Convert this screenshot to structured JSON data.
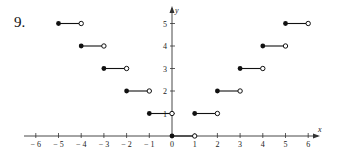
{
  "problem": {
    "number": "9."
  },
  "colors": {
    "ink": "#111111",
    "axis": "#333333",
    "background": "#ffffff"
  },
  "chart_data": {
    "type": "line",
    "title": "",
    "xlabel": "x",
    "ylabel": "y",
    "xlim": [
      -6.4,
      6.6
    ],
    "ylim": [
      0,
      5.6
    ],
    "grid": false,
    "x_ticks": [
      -6,
      -5,
      -4,
      -3,
      -2,
      -1,
      0,
      1,
      2,
      3,
      4,
      5,
      6
    ],
    "x_tick_labels": [
      "− 6",
      "− 5",
      "− 4",
      "− 3",
      "− 2",
      "− 1",
      "0",
      "1",
      "2",
      "3",
      "4",
      "5",
      "6"
    ],
    "y_ticks": [
      1,
      2,
      3,
      4,
      5
    ],
    "y_tick_labels": [
      "1",
      "2",
      "3",
      "4",
      "5"
    ],
    "segments": [
      {
        "x_start": -5,
        "x_end": -4,
        "y": 5,
        "start": "closed",
        "end": "open"
      },
      {
        "x_start": -4,
        "x_end": -3,
        "y": 4,
        "start": "closed",
        "end": "open"
      },
      {
        "x_start": -3,
        "x_end": -2,
        "y": 3,
        "start": "closed",
        "end": "open"
      },
      {
        "x_start": -2,
        "x_end": -1,
        "y": 2,
        "start": "closed",
        "end": "open"
      },
      {
        "x_start": -1,
        "x_end": 0,
        "y": 1,
        "start": "closed",
        "end": "open"
      },
      {
        "x_start": 0,
        "x_end": 1,
        "y": 0,
        "start": "closed",
        "end": "open"
      },
      {
        "x_start": 1,
        "x_end": 2,
        "y": 1,
        "start": "closed",
        "end": "open"
      },
      {
        "x_start": 2,
        "x_end": 3,
        "y": 2,
        "start": "closed",
        "end": "open"
      },
      {
        "x_start": 3,
        "x_end": 4,
        "y": 3,
        "start": "closed",
        "end": "open"
      },
      {
        "x_start": 4,
        "x_end": 5,
        "y": 4,
        "start": "closed",
        "end": "open"
      },
      {
        "x_start": 5,
        "x_end": 6,
        "y": 5,
        "start": "closed",
        "end": "open"
      }
    ]
  }
}
